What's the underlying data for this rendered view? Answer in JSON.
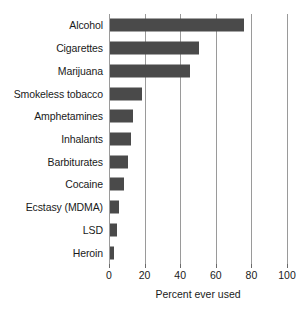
{
  "chart_data": {
    "type": "bar",
    "orientation": "horizontal",
    "title": "",
    "xlabel": "Percent ever used",
    "ylabel": "",
    "xlim": [
      0,
      100
    ],
    "xticks": [
      0,
      20,
      40,
      60,
      80,
      100
    ],
    "xtick_labels": [
      "0",
      "20",
      "40",
      "60",
      "80",
      "100"
    ],
    "grid": "vertical",
    "legend": "none",
    "bar_color": "#4a4a4a",
    "gridline_color": "#9a9a9a",
    "categories": [
      "Alcohol",
      "Cigarettes",
      "Marijuana",
      "Smokeless tobacco",
      "Amphetamines",
      "Inhalants",
      "Barbiturates",
      "Cocaine",
      "Ecstasy (MDMA)",
      "LSD",
      "Heroin"
    ],
    "values": [
      75,
      50,
      45,
      18,
      13,
      12,
      10,
      8,
      5,
      4,
      2
    ]
  }
}
